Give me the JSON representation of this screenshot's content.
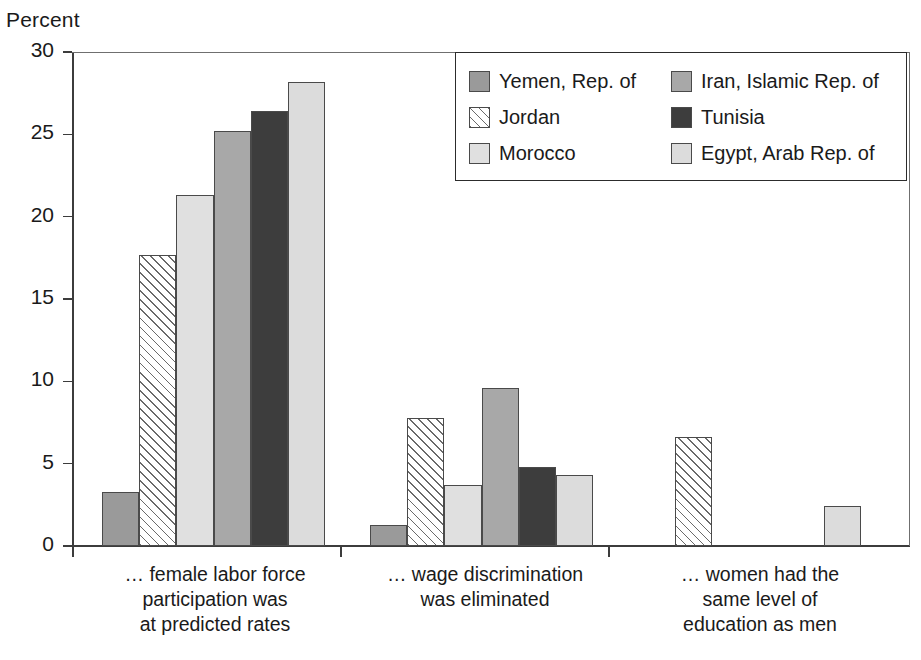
{
  "chart_data": {
    "type": "bar",
    "title": "",
    "subtitle": "",
    "ylabel": "Percent",
    "xlabel": "",
    "ylim": [
      0,
      30
    ],
    "yticks": [
      0,
      5,
      10,
      15,
      20,
      25,
      30
    ],
    "grid": false,
    "legend_position": "top-right",
    "legend_columns": 2,
    "categories": [
      "… female labor force participation was at predicted rates",
      "… wage discrimination was eliminated",
      "… women had the same level of education as men"
    ],
    "category_lines": [
      [
        "… female labor force",
        "participation was",
        "at predicted rates"
      ],
      [
        "… wage discrimination",
        "was eliminated"
      ],
      [
        "… women had the",
        "same level of",
        "education as men"
      ]
    ],
    "series": [
      {
        "name": "Yemen, Rep. of",
        "values": [
          3.3,
          1.3,
          null
        ],
        "fill": "#9a9a9a",
        "pattern": "solid"
      },
      {
        "name": "Jordan",
        "values": [
          17.7,
          7.8,
          6.6
        ],
        "fill": "#ffffff",
        "pattern": "diagonal-hatch"
      },
      {
        "name": "Morocco",
        "values": [
          21.3,
          3.7,
          null
        ],
        "fill": "#e0e0e0",
        "pattern": "solid"
      },
      {
        "name": "Iran, Islamic Rep. of",
        "values": [
          25.2,
          9.6,
          null
        ],
        "fill": "#a8a8a8",
        "pattern": "solid"
      },
      {
        "name": "Tunisia",
        "values": [
          26.4,
          4.8,
          null
        ],
        "fill": "#3d3d3d",
        "pattern": "solid"
      },
      {
        "name": "Egypt, Arab Rep. of",
        "values": [
          28.2,
          4.3,
          2.45
        ],
        "fill": "#dcdcdc",
        "pattern": "solid"
      }
    ]
  },
  "legend": {
    "columns": [
      [
        {
          "label": "Yemen, Rep. of",
          "fill": "#9a9a9a",
          "pattern": "solid"
        },
        {
          "label": "Jordan",
          "fill": "#ffffff",
          "pattern": "diagonal-hatch"
        },
        {
          "label": "Morocco",
          "fill": "#e0e0e0",
          "pattern": "solid"
        }
      ],
      [
        {
          "label": "Iran, Islamic Rep. of",
          "fill": "#a8a8a8",
          "pattern": "solid"
        },
        {
          "label": "Tunisia",
          "fill": "#3d3d3d",
          "pattern": "solid"
        },
        {
          "label": "Egypt, Arab Rep. of",
          "fill": "#dcdcdc",
          "pattern": "solid"
        }
      ]
    ]
  },
  "axis": {
    "y_title": "Percent",
    "tick_labels": [
      "30",
      "25",
      "20",
      "15",
      "10",
      "5",
      "0"
    ]
  },
  "colors": {
    "axis": "#3c3c3c",
    "frame": "#6f6f6f",
    "bar_edge": "#4a4a4a",
    "text": "#1a1a1a",
    "background": "#ffffff"
  }
}
